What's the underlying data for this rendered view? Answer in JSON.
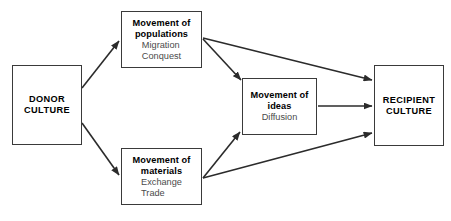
{
  "diagram": {
    "stroke_color": "#2b2b2b",
    "box_border_color": "#3a3a3a",
    "background_color": "#ffffff",
    "subtext_color": "#4b4b4b",
    "nodes": {
      "donor": {
        "title": "DONOR\nCULTURE",
        "sub": []
      },
      "populations": {
        "title": "Movement of\npopulations",
        "sub": [
          "Migration",
          "Conquest"
        ]
      },
      "materials": {
        "title": "Movement of\nmaterials",
        "sub": [
          "Exchange",
          "Trade"
        ]
      },
      "ideas": {
        "title": "Movement of\nideas",
        "sub": [
          "Diffusion"
        ]
      },
      "recipient": {
        "title": "RECIPIENT\nCULTURE",
        "sub": []
      }
    },
    "edges": [
      {
        "name": "donor-to-populations",
        "from": "donor",
        "to": "populations",
        "x1": 82,
        "y1": 88,
        "x2": 119,
        "y2": 41
      },
      {
        "name": "donor-to-materials",
        "from": "donor",
        "to": "materials",
        "x1": 82,
        "y1": 123,
        "x2": 119,
        "y2": 175
      },
      {
        "name": "populations-to-ideas",
        "from": "populations",
        "to": "ideas",
        "x1": 203,
        "y1": 39,
        "x2": 241,
        "y2": 80
      },
      {
        "name": "populations-to-recipient",
        "from": "populations",
        "to": "recipient",
        "x1": 203,
        "y1": 38,
        "x2": 372,
        "y2": 80
      },
      {
        "name": "materials-to-ideas",
        "from": "materials",
        "to": "ideas",
        "x1": 203,
        "y1": 178,
        "x2": 240,
        "y2": 132
      },
      {
        "name": "materials-to-recipient",
        "from": "materials",
        "to": "recipient",
        "x1": 203,
        "y1": 178,
        "x2": 372,
        "y2": 133
      },
      {
        "name": "ideas-to-recipient",
        "from": "ideas",
        "to": "recipient",
        "x1": 318,
        "y1": 106,
        "x2": 372,
        "y2": 106
      }
    ]
  }
}
